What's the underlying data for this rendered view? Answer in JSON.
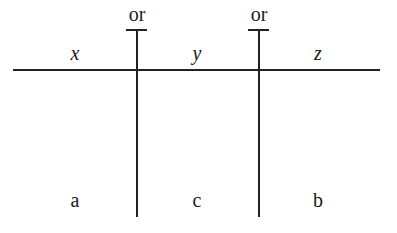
{
  "diagram": {
    "top_labels": [
      "or",
      "or"
    ],
    "variables": [
      "x",
      "y",
      "z"
    ],
    "values": [
      "a",
      "c",
      "b"
    ]
  }
}
